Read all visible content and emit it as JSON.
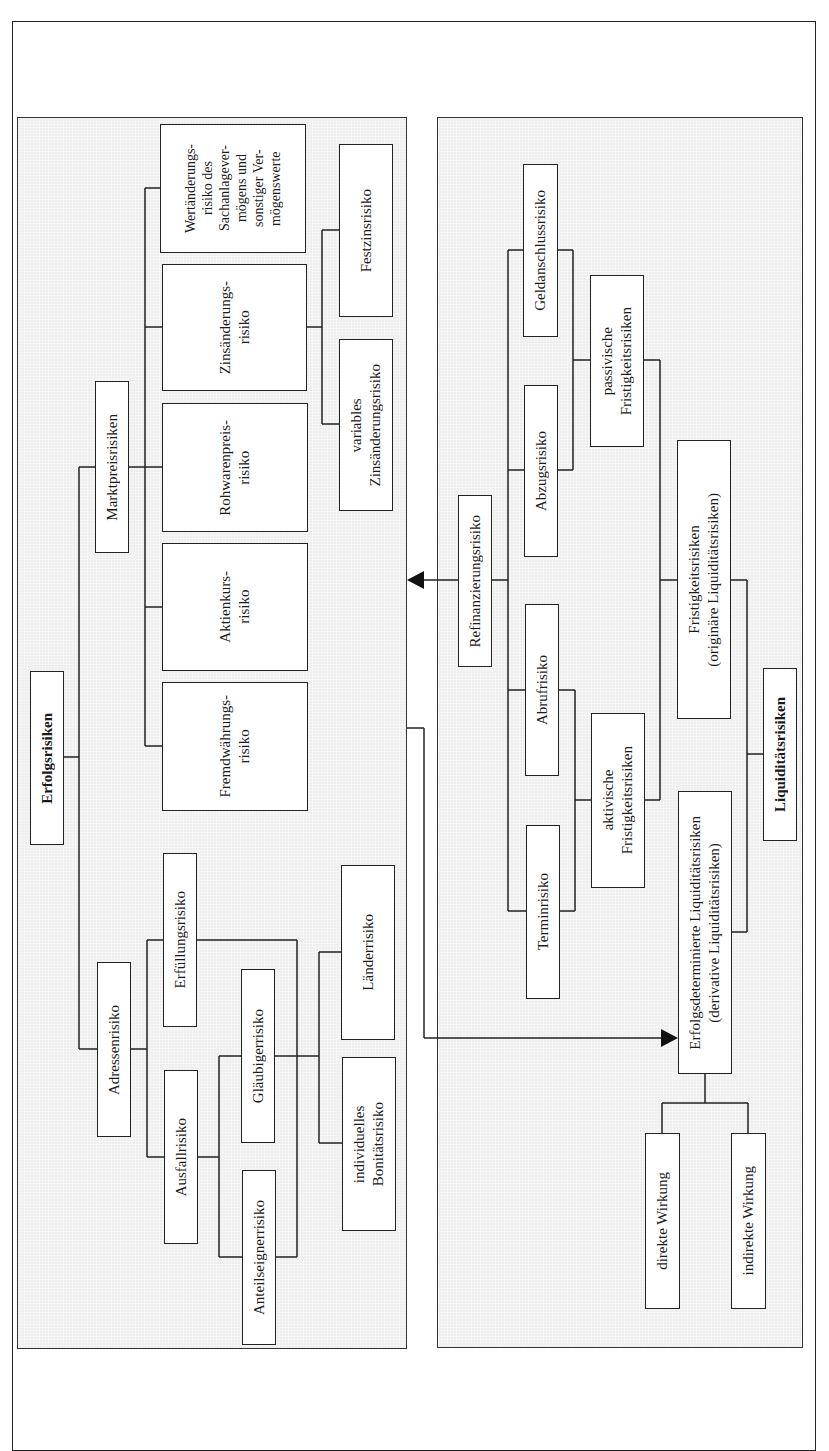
{
  "panels": {
    "left": {
      "title": "Erfolgsrisiken"
    },
    "right": {
      "title": "Liquiditätsrisiken"
    }
  },
  "nodes": {
    "erfolgsrisiken": "Erfolgsrisiken",
    "adressenrisiko": "Adressenrisiko",
    "marktpreisrisiken": "Marktpreisrisiken",
    "erfuellungsrisiko": "Erfüllungsrisiko",
    "ausfallrisiko": "Ausfallrisiko",
    "glaeubigerrisiko": "Gläubigerrisiko",
    "anteilseignerrisiko": "Anteilseignerrisiko",
    "laenderrisiko": "Länderrisiko",
    "bonitaetsrisiko": "individuelles\nBonitätsrisiko",
    "fremdwaehrungsrisiko": "Fremdwährungs-\nrisiko",
    "aktienkursrisiko": "Aktienkurs-\nrisiko",
    "rohwarenpreisrisiko": "Rohwarenpreis-\nrisiko",
    "zinsaenderungsrisiko": "Zinsänderungs-\nrisiko",
    "wertaenderungsrisiko": "Wertänderungs-\nrisiko des\nSachanlagever-\nmögens und\nsonstiger Ver-\nmögenswerte",
    "festzinsrisiko": "Festzinsrisiko",
    "variables_zinsaenderungsrisiko": "variables\nZinsänderungsrisiko",
    "refinanzierungsrisiko": "Refinanzierungsrisiko",
    "geldanschlussrisiko": "Geldanschlussrisiko",
    "abzugsrisiko": "Abzugsrisiko",
    "abrufrisiko": "Abrufrisiko",
    "terminrisiko": "Terminrisiko",
    "passivische_fristigkeitsrisiken": "passivische\nFristigkeitsrisiken",
    "aktivische_fristigkeitsrisiken": "aktivische\nFristigkeitsrisiken",
    "fristigkeitsrisiken": "Fristigkeitsrisiken\n(originäre Liquiditätsrisiken)",
    "erfolgsdeterminierte": "Erfolgsdeterminierte Liquiditätsrisiken\n(derivative Liquiditätsrisiken)",
    "liquiditaetsrisiken": "Liquiditätsrisiken",
    "direkte_wirkung": "direkte Wirkung",
    "indirekte_wirkung": "indirekte Wirkung"
  },
  "colors": {
    "panel_fill": "#eeeeee",
    "box_fill": "#ffffff",
    "line": "#222222"
  }
}
